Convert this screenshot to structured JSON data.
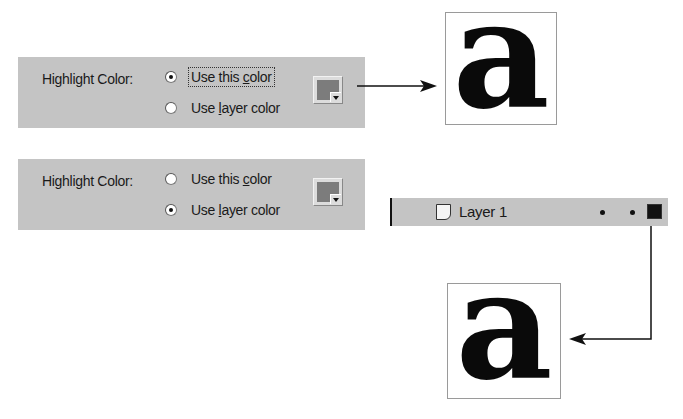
{
  "panels": [
    {
      "label": "Highlight Color:",
      "options": [
        {
          "text_pre": "Use this ",
          "mnemonic": "c",
          "text_post": "olor",
          "checked": true,
          "focused": true
        },
        {
          "text_pre": "Use ",
          "mnemonic": "l",
          "text_post": "ayer color",
          "checked": false,
          "focused": false
        }
      ],
      "swatch_color": "#7c7c7c"
    },
    {
      "label": "Highlight Color:",
      "options": [
        {
          "text_pre": "Use this ",
          "mnemonic": "c",
          "text_post": "olor",
          "checked": false,
          "focused": false
        },
        {
          "text_pre": "Use ",
          "mnemonic": "l",
          "text_post": "ayer color",
          "checked": true,
          "focused": false
        }
      ],
      "swatch_color": "#7c7c7c"
    }
  ],
  "samples": [
    {
      "glyph": "a"
    },
    {
      "glyph": "a"
    }
  ],
  "layer": {
    "name": "Layer 1",
    "icon": "layer-page-icon",
    "outline_color": "#111111"
  }
}
